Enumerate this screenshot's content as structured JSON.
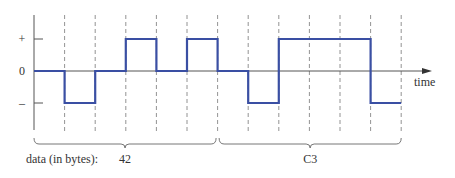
{
  "diagram": {
    "type": "signal-waveform",
    "y_levels": [
      "+",
      "0",
      "–"
    ],
    "x_axis_label": "time",
    "signal_levels": [
      0,
      -1,
      0,
      1,
      0,
      1,
      0,
      -1,
      1,
      1,
      1,
      -1
    ],
    "data_label": "data (in bytes):",
    "bytes": [
      {
        "label": "42",
        "interval_start": 0,
        "interval_end": 6
      },
      {
        "label": "C3",
        "interval_start": 6,
        "interval_end": 12
      }
    ],
    "colors": {
      "signal": "#3a4fa3",
      "axis": "#555555",
      "grid": "#777777",
      "text": "#333333"
    }
  }
}
